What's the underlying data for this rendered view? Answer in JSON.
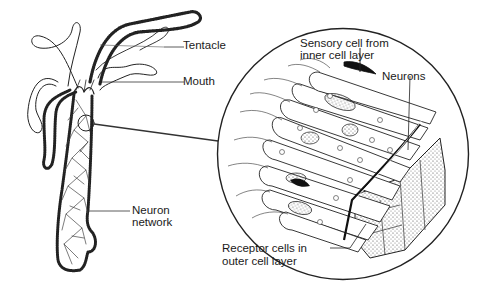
{
  "diagram": {
    "labels": {
      "tentacle": "Tentacle",
      "mouth": "Mouth",
      "neuron_network_line1": "Neuron",
      "neuron_network_line2": "network",
      "sensory_line1": "Sensory cell from",
      "sensory_line2": "inner cell layer",
      "neurons": "Neurons",
      "receptor_line1": "Receptor cells in",
      "receptor_line2": "outer cell layer"
    },
    "colors": {
      "ink": "#1a1a1a",
      "background": "#ffffff",
      "stipple": "#555555"
    }
  }
}
